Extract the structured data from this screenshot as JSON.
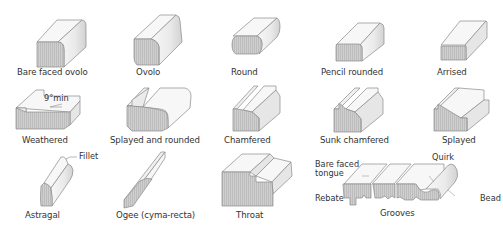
{
  "diagram": {
    "type": "mouldings-catalog",
    "colors": {
      "top_face": "#f7f7f7",
      "side_face": "#e6e6e6",
      "end_face": "#c9c9c9",
      "outline": "#8a8a8a",
      "text": "#333333"
    },
    "rows": [
      {
        "items": [
          {
            "id": "bare-faced-ovolo",
            "label": "Bare faced ovolo"
          },
          {
            "id": "ovolo",
            "label": "Ovolo"
          },
          {
            "id": "round",
            "label": "Round"
          },
          {
            "id": "pencil-rounded",
            "label": "Pencil rounded"
          },
          {
            "id": "arrised",
            "label": "Arrised"
          }
        ]
      },
      {
        "items": [
          {
            "id": "weathered",
            "label": "Weathered",
            "annotation": "9°min"
          },
          {
            "id": "splayed-and-rounded",
            "label": "Splayed and rounded"
          },
          {
            "id": "chamfered",
            "label": "Chamfered"
          },
          {
            "id": "sunk-chamfered",
            "label": "Sunk  chamfered"
          },
          {
            "id": "splayed",
            "label": "Splayed"
          }
        ]
      },
      {
        "items": [
          {
            "id": "astragal",
            "label": "Astragal",
            "callouts": [
              "Fillet"
            ]
          },
          {
            "id": "ogee",
            "label": "Ogee (cyma-recta)"
          },
          {
            "id": "throat",
            "label": "Throat"
          },
          {
            "id": "grooves",
            "label": "Grooves",
            "callouts": [
              "Bare faced tongue",
              "Rebate",
              "Quirk",
              "Bead"
            ]
          }
        ]
      }
    ],
    "callouts": {
      "fillet": "Fillet",
      "bare_faced_tongue_line1": "Bare faced",
      "bare_faced_tongue_line2": "tongue",
      "rebate": "Rebate",
      "quirk": "Quirk",
      "bead": "Bead",
      "weathered_angle": "9°min"
    }
  }
}
